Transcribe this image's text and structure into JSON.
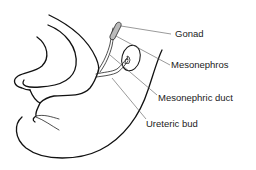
{
  "diagram": {
    "labels": [
      {
        "id": "gonad",
        "text": "Gonad"
      },
      {
        "id": "mesonephros",
        "text": "Mesonephros"
      },
      {
        "id": "mesonephric-duct",
        "text": "Mesonephric duct"
      },
      {
        "id": "ureteric-bud",
        "text": "Ureteric bud"
      }
    ],
    "colors": {
      "line": "#111111",
      "leader": "#555555",
      "text": "#222222",
      "gonad_fill": "#bbbbbb",
      "background": "#ffffff"
    }
  }
}
